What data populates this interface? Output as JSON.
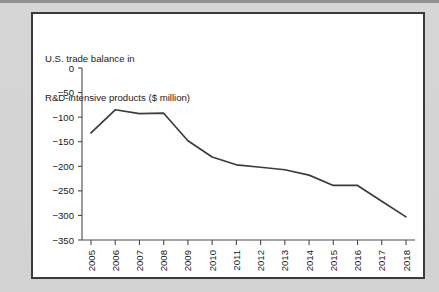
{
  "figure": {
    "title_line1": "U.S. trade balance in",
    "title_line2": "R&D-intensive products ($ million)",
    "panel_background": "#ffffff",
    "page_background": "#d2d2d2",
    "border_color": "#3a3a3a",
    "line_color": "#3c3c3c",
    "axis_color": "#4a4a4a"
  },
  "chart_data": {
    "type": "line",
    "title": "U.S. trade balance in R&D-intensive products ($ million)",
    "xlabel": "",
    "ylabel": "",
    "categories": [
      "2005",
      "2006",
      "2007",
      "2008",
      "2009",
      "2010",
      "2011",
      "2012",
      "2013",
      "2014",
      "2015",
      "2016",
      "2017",
      "2018"
    ],
    "x": [
      2005,
      2006,
      2007,
      2008,
      2009,
      2010,
      2011,
      2012,
      2013,
      2014,
      2015,
      2016,
      2017,
      2018
    ],
    "values": [
      -132,
      -85,
      -93,
      -92,
      -148,
      -181,
      -197,
      -202,
      -207,
      -218,
      -239,
      -239,
      -271,
      -303
    ],
    "series": [
      {
        "name": "U.S. trade balance in R&D-intensive products ($ million)",
        "values": [
          -132,
          -85,
          -93,
          -92,
          -148,
          -181,
          -197,
          -202,
          -207,
          -218,
          -239,
          -239,
          -271,
          -303
        ]
      }
    ],
    "ylim": [
      -350,
      0
    ],
    "xlim": [
      2005,
      2018
    ],
    "yticks": [
      0,
      -50,
      -100,
      -150,
      -200,
      -250,
      -300,
      -350
    ],
    "ytick_labels": [
      "0",
      "−50",
      "−100",
      "−150",
      "−200",
      "−250",
      "−300",
      "−350"
    ],
    "xtick_labels": [
      "2005",
      "2006",
      "2007",
      "2008",
      "2009",
      "2010",
      "2011",
      "2012",
      "2013",
      "2014",
      "2015",
      "2016",
      "2017",
      "2018"
    ],
    "xtick_rotation": 90,
    "grid": false,
    "legend": false,
    "legend_position": "none"
  }
}
